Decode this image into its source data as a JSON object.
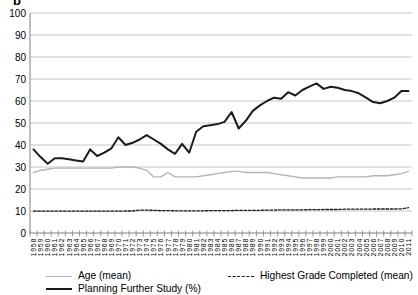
{
  "panel_label": "b",
  "colors": {
    "background": "#ffffff",
    "gridline": "#c6c6c6",
    "axis": "#808080",
    "text": "#000000"
  },
  "chart_data": {
    "type": "line",
    "title": "",
    "xlabel": "",
    "ylabel": "",
    "ylim": [
      0,
      100
    ],
    "ytick_interval": 10,
    "grid": "horizontal",
    "legend_position": "bottom",
    "x": [
      1958,
      1959,
      1960,
      1961,
      1962,
      1963,
      1964,
      1965,
      1966,
      1967,
      1968,
      1969,
      1970,
      1971,
      1972,
      1973,
      1974,
      1975,
      1976,
      1977,
      1978,
      1979,
      1980,
      1981,
      1982,
      1983,
      1984,
      1985,
      1986,
      1987,
      1988,
      1989,
      1990,
      1991,
      1992,
      1993,
      1994,
      1995,
      1996,
      1997,
      1998,
      1999,
      2000,
      2001,
      2002,
      2003,
      2004,
      2005,
      2006,
      2007,
      2008,
      2009,
      2010,
      2011
    ],
    "series": [
      {
        "id": "age-mean",
        "name": "Age (mean)",
        "color": "#b5b5b5",
        "style": "solid",
        "width": 1.4,
        "values": [
          27.5,
          28.5,
          29,
          29.5,
          29.5,
          29.5,
          29.5,
          29.5,
          29.5,
          29.5,
          29.5,
          29.5,
          30,
          30,
          30,
          29.5,
          28.5,
          25.5,
          25.5,
          27.5,
          25.5,
          25.5,
          25.5,
          25.5,
          26,
          26.5,
          27,
          27.5,
          28,
          28,
          27.5,
          27.5,
          27.5,
          27.5,
          27,
          26.5,
          26,
          25.5,
          25,
          25,
          25,
          25,
          25,
          25.5,
          25.5,
          25.5,
          25.5,
          25.5,
          26,
          26,
          26,
          26.5,
          27,
          28
        ]
      },
      {
        "id": "highest-grade-completed",
        "name": "Highest Grade Completed (mean)",
        "color": "#1c1c1c",
        "style": "dashed",
        "width": 1.3,
        "values": [
          9.9,
          9.9,
          9.9,
          9.9,
          9.9,
          9.9,
          9.9,
          9.9,
          9.9,
          9.9,
          9.9,
          9.9,
          9.9,
          10,
          10,
          10.4,
          10.4,
          10.3,
          10.2,
          10.2,
          10.1,
          10.1,
          10.1,
          10.1,
          10.1,
          10.2,
          10.2,
          10.2,
          10.2,
          10.3,
          10.3,
          10.3,
          10.3,
          10.4,
          10.4,
          10.5,
          10.5,
          10.5,
          10.5,
          10.6,
          10.6,
          10.7,
          10.7,
          10.7,
          10.8,
          10.8,
          10.8,
          10.8,
          10.9,
          10.9,
          10.9,
          10.9,
          11,
          11.5
        ]
      },
      {
        "id": "planning-further-study",
        "name": "Planning Further Study (%)",
        "color": "#1c1c1c",
        "style": "solid",
        "width": 2,
        "values": [
          38,
          34.5,
          31.5,
          34,
          34,
          33.5,
          33,
          32.5,
          38,
          35,
          36.5,
          38.5,
          43.5,
          40,
          41,
          42.5,
          44.5,
          42.5,
          40.5,
          38,
          36,
          40.5,
          36.5,
          46,
          48.5,
          49,
          49.5,
          50.5,
          55,
          47.5,
          51,
          55.5,
          58,
          60,
          61.5,
          61,
          64,
          62.5,
          65,
          66.5,
          68,
          65.5,
          66.5,
          66,
          65,
          64.5,
          63.5,
          61.5,
          59.5,
          59,
          60,
          61.5,
          64.5,
          64.5
        ]
      }
    ]
  }
}
